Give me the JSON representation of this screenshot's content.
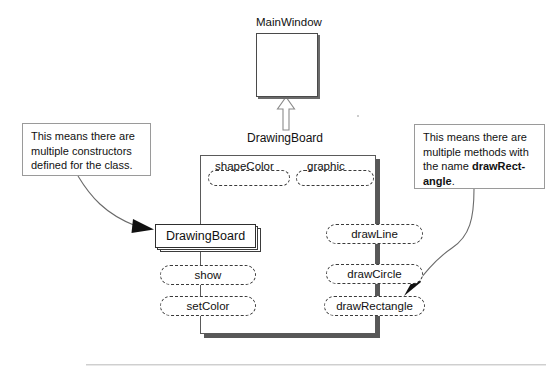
{
  "diagram": {
    "title_hidden": "",
    "superclass": {
      "name": "MainWindow"
    },
    "subclass": {
      "name": "DrawingBoard"
    },
    "attributes": [
      {
        "name": "shapeColor"
      },
      {
        "name": "graphic"
      }
    ],
    "constructors": [
      {
        "name": "DrawingBoard",
        "multiple": "true"
      }
    ],
    "left_methods": [
      {
        "name": "show"
      },
      {
        "name": "setColor"
      }
    ],
    "right_methods": [
      {
        "name": "drawLine"
      },
      {
        "name": "drawCircle"
      },
      {
        "name": "drawRectangle"
      }
    ],
    "notes": [
      {
        "id": "constructors-note",
        "line1": "This means there are",
        "line2": "multiple constructors",
        "line3": "defined for the class.",
        "bold": ""
      },
      {
        "id": "methods-note",
        "line1": "This means there are",
        "line2": "multiple methods with",
        "line3_prefix": "the name ",
        "bold1": "drawRect-",
        "bold2": "angle",
        "line4_suffix": "."
      }
    ],
    "colors": {
      "ink": "#111111",
      "box_border": "#4a4a4a",
      "shadow": "#585858",
      "note_border": "#9a9a9a",
      "dashed": "#3a3a3a",
      "thick_connector": "#4f4f4f",
      "rule": "#cfcfcf"
    },
    "icons": {
      "generalization": "hollow-triangle-arrow-up",
      "pointer_left": "curved-arrow-right",
      "pointer_right": "curved-arrow-down-left"
    }
  }
}
